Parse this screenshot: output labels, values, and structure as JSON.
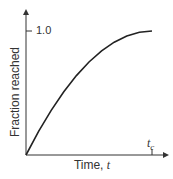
{
  "chart_data": {
    "type": "line",
    "title": "",
    "xlabel": "Time, t",
    "ylabel": "Fraction reached",
    "x_ticks": [
      {
        "label": "t_c",
        "position": 1.0
      }
    ],
    "y_ticks": [
      {
        "label": "1.0",
        "value": 1.0
      }
    ],
    "xlim": [
      0,
      1.1
    ],
    "ylim": [
      0,
      1.15
    ],
    "grid": false,
    "legend": null,
    "series": [
      {
        "name": "fraction",
        "x": [
          0,
          0.1,
          0.2,
          0.3,
          0.4,
          0.5,
          0.6,
          0.7,
          0.8,
          0.9,
          1.0
        ],
        "values": [
          0,
          0.19,
          0.36,
          0.51,
          0.64,
          0.75,
          0.84,
          0.91,
          0.96,
          0.99,
          1.0
        ]
      }
    ],
    "color": "#222222"
  },
  "labels": {
    "ylabel": "Fraction reached",
    "xlabel_text": "Time, ",
    "xlabel_var": "t",
    "ytick": "1.0",
    "xtick_main": "t",
    "xtick_sub": "c"
  }
}
